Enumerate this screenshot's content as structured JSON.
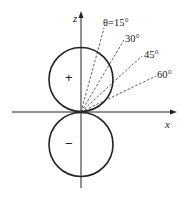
{
  "diagram": {
    "type": "polar-dipole-lobes",
    "axes": {
      "z_label": "z",
      "x_label": "x"
    },
    "lobes": [
      {
        "position": "upper",
        "sign": "+"
      },
      {
        "position": "lower",
        "sign": "−"
      }
    ],
    "angle_lines": [
      {
        "label": "θ=15°",
        "theta_deg": 15
      },
      {
        "label": "30°",
        "theta_deg": 30
      },
      {
        "label": "45°",
        "theta_deg": 45
      },
      {
        "label": "60°",
        "theta_deg": 60
      }
    ],
    "colors": {
      "stroke": "#222222",
      "background": "#ffffff"
    }
  }
}
